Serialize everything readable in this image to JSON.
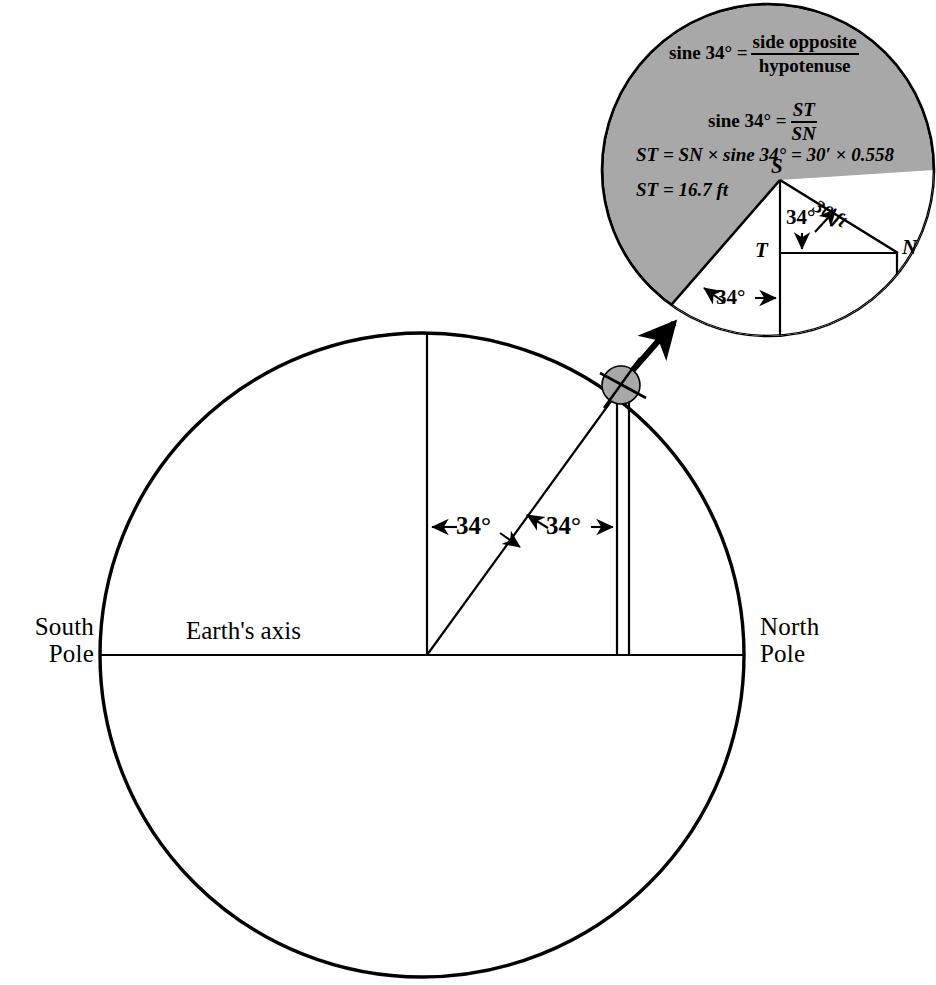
{
  "figure": {
    "background_color": "#ffffff",
    "ink_color": "#000000",
    "shade_color": "#a8a8a8",
    "width": 936,
    "height": 985
  },
  "earth": {
    "south_pole_label": "South\nPole",
    "north_pole_label": "North\nPole",
    "axis_label": "Earth's axis",
    "angle_left_label": "34°",
    "angle_right_label": "34°",
    "center": {
      "x": 422,
      "y": 655
    },
    "radius": 322,
    "tilt_degrees": 34
  },
  "magnifier": {
    "center": {
      "x": 768,
      "y": 170
    },
    "radius": 166,
    "shaded": true,
    "source_spot": {
      "x": 621,
      "y": 385,
      "radius": 18
    },
    "points": {
      "s": "S",
      "t": "T",
      "n": "N"
    },
    "hypotenuse_label": "30 ft",
    "angle_upper_label": "34°",
    "angle_lower_label": "34°",
    "formulas": {
      "line1": {
        "lhs": "sine 34° =",
        "numerator": "side opposite",
        "denominator": "hypotenuse"
      },
      "line2": {
        "lhs": "sine 34° =",
        "numerator": "ST",
        "denominator": "SN"
      },
      "line3": "ST = SN × sine 34° = 30′ × 0.558",
      "line4": "ST = 16.7 ft"
    }
  }
}
